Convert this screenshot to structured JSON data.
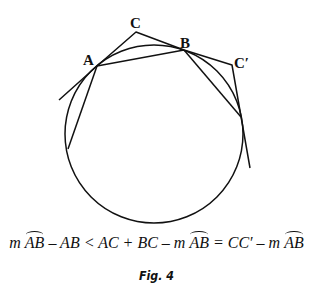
{
  "diagram": {
    "labels": {
      "A": "A",
      "B": "B",
      "C": "C",
      "Cprime": "C′"
    },
    "circle": {
      "cx": 154,
      "cy": 134,
      "r": 89
    },
    "points": {
      "A": [
        97,
        66
      ],
      "B": [
        184,
        50
      ],
      "C": [
        136,
        32
      ],
      "Cprime": [
        232,
        65
      ],
      "tangentA_end": [
        59,
        100
      ],
      "chordA_end": [
        68,
        149
      ],
      "chordB_end": [
        241,
        117
      ],
      "tangentCprime_end": [
        250,
        168
      ]
    },
    "stroke_color": "#111111"
  },
  "formula": {
    "m1": "m ",
    "arc1": "AB",
    "t1": " – AB < AC + BC – ",
    "m2": "m ",
    "arc2": "AB",
    "t2": " = CC′ – ",
    "m3": "m ",
    "arc3": "AB"
  },
  "caption": "Fig. 4"
}
